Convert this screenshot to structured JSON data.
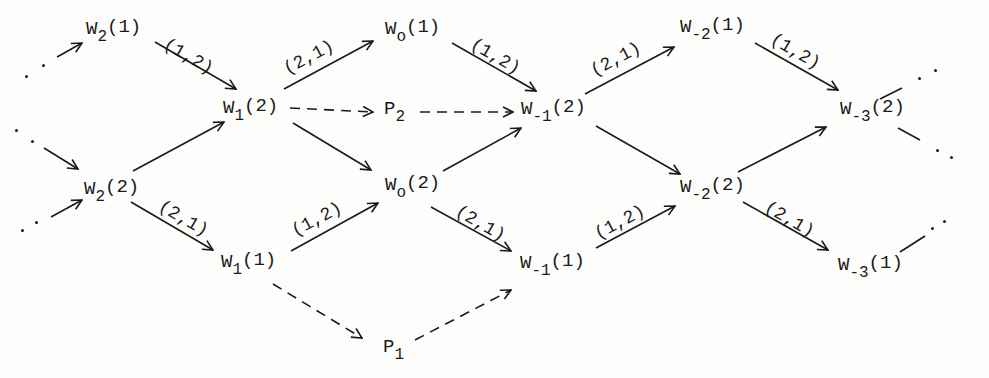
{
  "diagram": {
    "type": "directed-graph",
    "nodes": [
      {
        "id": "W2_1",
        "base": "W",
        "sub": "2",
        "arg": "(1)",
        "x": 86,
        "y": 20
      },
      {
        "id": "W2_2",
        "base": "W",
        "sub": "2",
        "arg": "(2)",
        "x": 84,
        "y": 180
      },
      {
        "id": "W1_2",
        "base": "W",
        "sub": "1",
        "arg": "(2)",
        "x": 223,
        "y": 99
      },
      {
        "id": "W1_1",
        "base": "W",
        "sub": "1",
        "arg": "(1)",
        "x": 221,
        "y": 253
      },
      {
        "id": "W0_1",
        "base": "W",
        "sub": "o",
        "arg": "(1)",
        "x": 385,
        "y": 20
      },
      {
        "id": "P2",
        "base": "P",
        "sub": "2",
        "arg": "",
        "x": 384,
        "y": 100
      },
      {
        "id": "W0_2",
        "base": "W",
        "sub": "o",
        "arg": "(2)",
        "x": 385,
        "y": 176
      },
      {
        "id": "P1",
        "base": "P",
        "sub": "1",
        "arg": "",
        "x": 383,
        "y": 338
      },
      {
        "id": "Wm1_2",
        "base": "W",
        "sub": "-1",
        "arg": "(2)",
        "x": 521,
        "y": 100
      },
      {
        "id": "Wm1_1",
        "base": "W",
        "sub": "-1",
        "arg": "(1)",
        "x": 520,
        "y": 254
      },
      {
        "id": "Wm2_1",
        "base": "W",
        "sub": "-2",
        "arg": "(1)",
        "x": 680,
        "y": 18
      },
      {
        "id": "Wm2_2",
        "base": "W",
        "sub": "-2",
        "arg": "(2)",
        "x": 680,
        "y": 178
      },
      {
        "id": "Wm3_2",
        "base": "W",
        "sub": "-3",
        "arg": "(2)",
        "x": 840,
        "y": 100
      },
      {
        "id": "Wm3_1",
        "base": "W",
        "sub": "-3",
        "arg": "(1)",
        "x": 838,
        "y": 256
      }
    ],
    "edges": [
      {
        "from": "W2_1",
        "to": "W1_2",
        "style": "solid",
        "label": "(1,2)",
        "x1": 155,
        "y1": 42,
        "x2": 236,
        "y2": 89
      },
      {
        "from": "W2_2",
        "to": "W1_2",
        "style": "solid",
        "label": "",
        "x1": 133,
        "y1": 171,
        "x2": 224,
        "y2": 122
      },
      {
        "from": "W2_2",
        "to": "W1_1",
        "style": "solid",
        "label": "(2,1)",
        "x1": 131,
        "y1": 202,
        "x2": 213,
        "y2": 250
      },
      {
        "from": "W1_2",
        "to": "W0_1",
        "style": "solid",
        "label": "(2,1)",
        "x1": 284,
        "y1": 89,
        "x2": 373,
        "y2": 41
      },
      {
        "from": "W1_2",
        "to": "P2",
        "style": "dashed",
        "label": "",
        "x1": 290,
        "y1": 108,
        "x2": 373,
        "y2": 112
      },
      {
        "from": "W1_2",
        "to": "W0_2",
        "style": "solid",
        "label": "",
        "x1": 293,
        "y1": 123,
        "x2": 371,
        "y2": 170
      },
      {
        "from": "W1_1",
        "to": "W0_2",
        "style": "solid",
        "label": "(1,2)",
        "x1": 291,
        "y1": 251,
        "x2": 378,
        "y2": 203
      },
      {
        "from": "W1_1",
        "to": "P1",
        "style": "dashed",
        "label": "",
        "x1": 273,
        "y1": 284,
        "x2": 362,
        "y2": 338
      },
      {
        "from": "W0_1",
        "to": "Wm1_2",
        "style": "solid",
        "label": "(1,2)",
        "x1": 452,
        "y1": 43,
        "x2": 536,
        "y2": 91
      },
      {
        "from": "P2",
        "to": "Wm1_2",
        "style": "dashed",
        "label": "",
        "x1": 420,
        "y1": 112,
        "x2": 513,
        "y2": 112
      },
      {
        "from": "W0_2",
        "to": "Wm1_2",
        "style": "solid",
        "label": "",
        "x1": 443,
        "y1": 171,
        "x2": 521,
        "y2": 128
      },
      {
        "from": "W0_2",
        "to": "Wm1_1",
        "style": "solid",
        "label": "(2,1)",
        "x1": 431,
        "y1": 207,
        "x2": 511,
        "y2": 251
      },
      {
        "from": "P1",
        "to": "Wm1_1",
        "style": "dashed",
        "label": "",
        "x1": 415,
        "y1": 340,
        "x2": 511,
        "y2": 290
      },
      {
        "from": "Wm1_2",
        "to": "Wm2_1",
        "style": "solid",
        "label": "(2,1)",
        "x1": 585,
        "y1": 94,
        "x2": 674,
        "y2": 47
      },
      {
        "from": "Wm1_2",
        "to": "Wm2_2",
        "style": "solid",
        "label": "",
        "x1": 596,
        "y1": 126,
        "x2": 680,
        "y2": 174
      },
      {
        "from": "Wm1_1",
        "to": "Wm2_2",
        "style": "solid",
        "label": "(1,2)",
        "x1": 596,
        "y1": 248,
        "x2": 675,
        "y2": 206
      },
      {
        "from": "Wm2_1",
        "to": "Wm3_2",
        "style": "solid",
        "label": "(1,2)",
        "x1": 755,
        "y1": 43,
        "x2": 838,
        "y2": 90
      },
      {
        "from": "Wm2_2",
        "to": "Wm3_2",
        "style": "solid",
        "label": "",
        "x1": 738,
        "y1": 172,
        "x2": 826,
        "y2": 127
      },
      {
        "from": "Wm2_2",
        "to": "Wm3_1",
        "style": "solid",
        "label": "(2,1)",
        "x1": 743,
        "y1": 202,
        "x2": 828,
        "y2": 250
      }
    ],
    "edge_labels": [
      {
        "text": "(1,2)",
        "x": 165,
        "y": 33,
        "angle": 30
      },
      {
        "text": "(2,1)",
        "x": 160,
        "y": 195,
        "angle": 30
      },
      {
        "text": "(2,1)",
        "x": 285,
        "y": 60,
        "angle": -28
      },
      {
        "text": "(1,2)",
        "x": 293,
        "y": 222,
        "angle": -28
      },
      {
        "text": "(1,2)",
        "x": 472,
        "y": 33,
        "angle": 30
      },
      {
        "text": "(2,1)",
        "x": 457,
        "y": 200,
        "angle": 30
      },
      {
        "text": "(2,1)",
        "x": 592,
        "y": 62,
        "angle": -28
      },
      {
        "text": "(1,2)",
        "x": 596,
        "y": 225,
        "angle": -28
      },
      {
        "text": "(1,2)",
        "x": 772,
        "y": 28,
        "angle": 30
      },
      {
        "text": "(2,1)",
        "x": 766,
        "y": 196,
        "angle": 30
      }
    ],
    "continuation_dots": {
      "left": [
        {
          "x": 26,
          "y": 76
        },
        {
          "x": 43,
          "y": 65
        },
        {
          "x": 16,
          "y": 130
        },
        {
          "x": 32,
          "y": 141
        },
        {
          "x": 22,
          "y": 230
        },
        {
          "x": 36,
          "y": 222
        }
      ],
      "right": [
        {
          "x": 919,
          "y": 78
        },
        {
          "x": 935,
          "y": 70
        },
        {
          "x": 937,
          "y": 150
        },
        {
          "x": 951,
          "y": 157
        },
        {
          "x": 932,
          "y": 228
        },
        {
          "x": 944,
          "y": 221
        }
      ]
    },
    "incoming_stubs": [
      {
        "x1": 57,
        "y1": 57,
        "x2": 82,
        "y2": 43,
        "arrow": true
      },
      {
        "x1": 44,
        "y1": 148,
        "x2": 78,
        "y2": 169,
        "arrow": true
      },
      {
        "x1": 51,
        "y1": 217,
        "x2": 82,
        "y2": 200,
        "arrow": true
      }
    ],
    "outgoing_stubs": [
      {
        "x1": 880,
        "y1": 99,
        "x2": 902,
        "y2": 88
      },
      {
        "x1": 898,
        "y1": 128,
        "x2": 920,
        "y2": 140
      },
      {
        "x1": 900,
        "y1": 252,
        "x2": 925,
        "y2": 236
      }
    ],
    "colors": {
      "ink": "#1a1a1a",
      "paper": "#fdfdfb"
    }
  }
}
